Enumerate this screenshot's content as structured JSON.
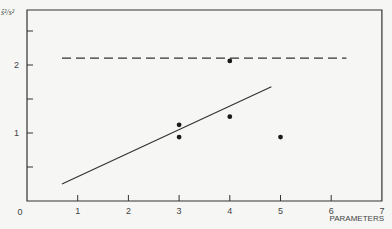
{
  "chart_data": {
    "type": "scatter",
    "title": "",
    "xlabel": "PARAMETERS",
    "ylabel": "ŝ²/s²",
    "xlim": [
      0,
      7
    ],
    "ylim": [
      0,
      2.8
    ],
    "x_ticks": [
      0,
      1,
      2,
      3,
      4,
      5,
      6,
      7
    ],
    "x_tick_labels": [
      "0",
      "1",
      "2",
      "3",
      "4",
      "5",
      "6",
      "7"
    ],
    "y_ticks": [
      0,
      0.5,
      1,
      1.5,
      2,
      2.5
    ],
    "y_tick_labels": [
      "0",
      "",
      "1",
      "",
      "2",
      ""
    ],
    "grid": false,
    "legend": null,
    "series": [
      {
        "name": "observations",
        "kind": "scatter",
        "points": [
          {
            "x": 3,
            "y": 1.12
          },
          {
            "x": 3,
            "y": 0.94
          },
          {
            "x": 4,
            "y": 2.06
          },
          {
            "x": 4,
            "y": 1.24
          },
          {
            "x": 5,
            "y": 0.94
          }
        ]
      },
      {
        "name": "fitted-trend",
        "kind": "line",
        "style": "solid",
        "points": [
          {
            "x": 0.69,
            "y": 0.25
          },
          {
            "x": 4.82,
            "y": 1.68
          }
        ]
      },
      {
        "name": "reference-level",
        "kind": "line",
        "style": "dashed",
        "points": [
          {
            "x": 0.69,
            "y": 2.1
          },
          {
            "x": 6.3,
            "y": 2.1
          }
        ]
      }
    ],
    "colors": {
      "ink": "#333333",
      "background": "#f6f6f4"
    }
  }
}
